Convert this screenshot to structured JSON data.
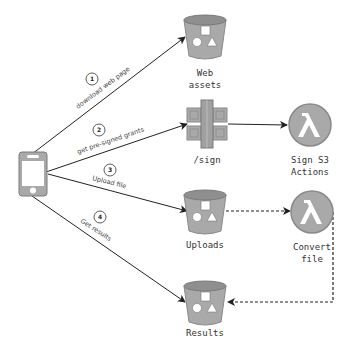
{
  "diagram": {
    "nodes": {
      "client": {
        "label": "",
        "icon": "mobile-phone-icon"
      },
      "web_assets": {
        "label_line1": "Web",
        "label_line2": "assets",
        "icon": "s3-bucket-icon"
      },
      "sign": {
        "label": "/sign",
        "icon": "api-gateway-icon"
      },
      "sign_s3_actions": {
        "label_line1": "Sign S3",
        "label_line2": "Actions",
        "icon": "lambda-icon"
      },
      "uploads": {
        "label": "Uploads",
        "icon": "s3-bucket-icon"
      },
      "convert_file": {
        "label_line1": "Convert",
        "label_line2": "file",
        "icon": "lambda-icon"
      },
      "results": {
        "label": "Results",
        "icon": "s3-bucket-icon"
      }
    },
    "edges": [
      {
        "step": "1",
        "label": "download web page",
        "from": "client",
        "to": "web_assets",
        "style": "solid"
      },
      {
        "step": "2",
        "label": "get pre-signed grants",
        "from": "client",
        "to": "sign",
        "style": "solid"
      },
      {
        "step": "3",
        "label": "Upload file",
        "from": "client",
        "to": "uploads",
        "style": "solid"
      },
      {
        "step": "4",
        "label": "Get results",
        "from": "client",
        "to": "results",
        "style": "solid"
      },
      {
        "step": "",
        "label": "",
        "from": "sign",
        "to": "sign_s3_actions",
        "style": "solid"
      },
      {
        "step": "",
        "label": "",
        "from": "uploads",
        "to": "convert_file",
        "style": "dashed"
      },
      {
        "step": "",
        "label": "",
        "from": "convert_file",
        "to": "results",
        "style": "dashed"
      }
    ],
    "colors": {
      "icon_fill": "#a9a9a9",
      "icon_dark": "#8a8a8a",
      "line": "#222222",
      "text": "#333333"
    }
  }
}
